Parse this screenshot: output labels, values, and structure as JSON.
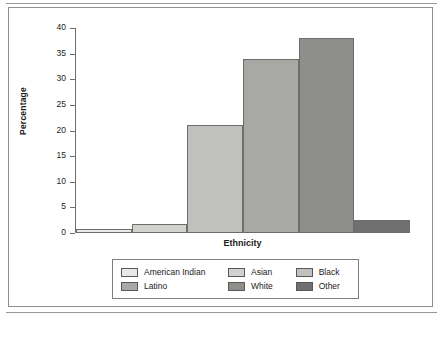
{
  "chart_data": {
    "type": "bar",
    "title": "",
    "xlabel": "Ethnicity",
    "ylabel": "Percentage",
    "categories": [
      "American Indian",
      "Asian",
      "Black",
      "Latino",
      "White",
      "Other"
    ],
    "values": [
      0.8,
      1.8,
      21,
      34,
      38,
      2.6
    ],
    "ylim": [
      0,
      40
    ],
    "yticks": [
      0,
      5,
      10,
      15,
      20,
      25,
      30,
      35,
      40
    ],
    "ytick_labels": [
      "0",
      "5",
      "10",
      "15",
      "20",
      "25",
      "30",
      "35",
      "40"
    ],
    "grid": false,
    "legend_position": "bottom",
    "series": [
      {
        "name": "Percentage",
        "values": [
          0.8,
          1.8,
          21,
          34,
          38,
          2.6
        ]
      }
    ],
    "colors": [
      "#e8e8e6",
      "#d2d2ce",
      "#c0c0bc",
      "#a8a8a4",
      "#8e8e8a",
      "#707070"
    ]
  },
  "legend": {
    "rows": [
      [
        {
          "label": "American Indian",
          "color": "#e8e8e6"
        },
        {
          "label": "Asian",
          "color": "#d2d2ce"
        },
        {
          "label": "Black",
          "color": "#c0c0bc"
        }
      ],
      [
        {
          "label": "Latino",
          "color": "#a8a8a4"
        },
        {
          "label": "White",
          "color": "#8e8e8a"
        },
        {
          "label": "Other",
          "color": "#707070"
        }
      ]
    ]
  }
}
